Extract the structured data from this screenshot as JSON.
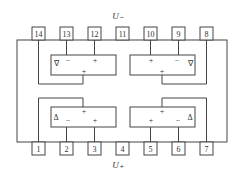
{
  "diagram": {
    "supply_top": "U₋",
    "supply_bottom": "U₊",
    "top_pins": [
      "14",
      "13",
      "12",
      "11",
      "10",
      "9",
      "8"
    ],
    "bottom_pins": [
      "1",
      "2",
      "3",
      "4",
      "5",
      "6",
      "7"
    ],
    "amp_symbol_top": "∇",
    "amp_symbol_bottom": "Δ",
    "minus": "−",
    "plus": "+"
  }
}
